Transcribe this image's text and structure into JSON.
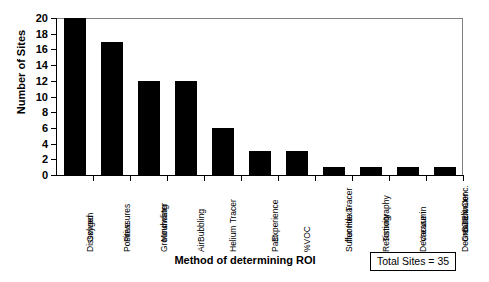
{
  "chart_data": {
    "type": "bar",
    "title": "",
    "xlabel": "Method of determining ROI",
    "ylabel": "Number of Sites",
    "categories": [
      "Dissolved Oxygen",
      "Positive Pressures",
      "Groundwater Mounding",
      "Air Bubbling",
      "Helium Tracer",
      "Past Experience",
      "%VOC",
      "Sulfer Hexa-fluoride Tracer",
      "Resistivity Tomography",
      "Decrease in Vacuum",
      "Decrease in Groundwater BTEX Conc."
    ],
    "category_lines": [
      [
        "Dissolved",
        "Oxygen"
      ],
      [
        "Positive",
        "Pressures"
      ],
      [
        "Groundwater",
        "Mounding"
      ],
      [
        "Air",
        "Bubbling"
      ],
      [
        "Helium Tracer"
      ],
      [
        "Past",
        "Experience"
      ],
      [
        "%VOC"
      ],
      [
        "Sulfer Hexa-",
        "fluoride Tracer"
      ],
      [
        "Resistivity",
        "Tomography"
      ],
      [
        "Decrease in",
        "Vacuum"
      ],
      [
        "Decrease in",
        "Groundwater",
        "BTEX Conc."
      ]
    ],
    "values": [
      20,
      17,
      12,
      12,
      6,
      3,
      3,
      1,
      1,
      1,
      1
    ],
    "ylim": [
      0,
      20
    ],
    "yticks": [
      0,
      2,
      4,
      6,
      8,
      10,
      12,
      14,
      16,
      18,
      20
    ],
    "ytick_labels": [
      "0",
      "2",
      "4",
      "6",
      "8",
      "10",
      "12",
      "14",
      "16",
      "18",
      "20"
    ],
    "grid": false,
    "legend": "none",
    "bar_color": "#000000",
    "annotation": "Total Sites = 35"
  },
  "annotation_box": {
    "text": "Total Sites = 35"
  }
}
